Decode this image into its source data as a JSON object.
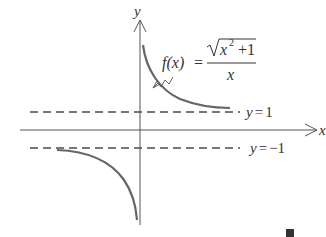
{
  "diagram": {
    "axes": {
      "x_label": "x",
      "y_label": "y"
    },
    "asymptotes": [
      {
        "label_var": "y",
        "label_eq": "=",
        "label_val": "1",
        "y_value": 1
      },
      {
        "label_var": "y",
        "label_eq": "=",
        "label_val": "−1",
        "y_value": -1
      }
    ],
    "function": {
      "lhs": "f(x)",
      "equals": "=",
      "numerator_radicand": "x",
      "numerator_exponent": "2",
      "numerator_rest": " +1",
      "denominator": "x",
      "expression": "f(x) = sqrt(x^2 + 1) / x"
    },
    "colors": {
      "curve": "#666666",
      "axes": "#555555",
      "asymptote": "#777777",
      "text": "#333333",
      "end_mark": "#333333"
    },
    "end_mark": "■"
  }
}
